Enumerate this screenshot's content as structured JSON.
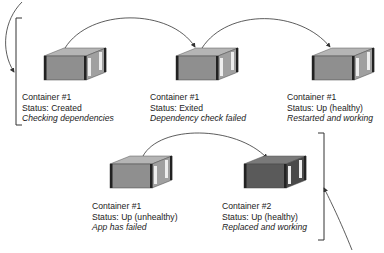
{
  "diagram": {
    "top_row": [
      {
        "name": "Container #1",
        "status": "Status: Created",
        "note": "Checking dependencies",
        "shade": "light"
      },
      {
        "name": "Container #1",
        "status": "Status: Exited",
        "note": "Dependency check failed",
        "shade": "light"
      },
      {
        "name": "Container #1",
        "status": "Status: Up (healthy)",
        "note": "Restarted and working",
        "shade": "light"
      }
    ],
    "bottom_row": [
      {
        "name": "Container #1",
        "status": "Status: Up (unhealthy)",
        "note": "App has failed",
        "shade": "light"
      },
      {
        "name": "Container #2",
        "status": "Status: Up (healthy)",
        "note": "Replaced and working",
        "shade": "dark"
      }
    ],
    "colors": {
      "container_light": "#8f8f8f",
      "container_dark": "#5a5a5a",
      "line": "#333333"
    }
  }
}
